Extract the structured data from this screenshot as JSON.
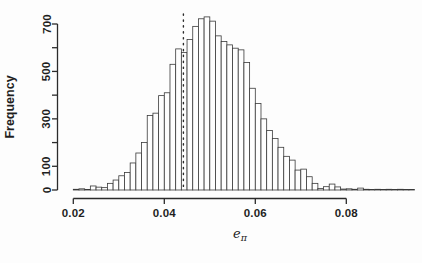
{
  "figure": {
    "background": "#fdfdfd",
    "line_color": "#2b2b2b",
    "text_color": "#1f1f1f"
  },
  "chart_data": {
    "type": "bar",
    "subtype": "histogram",
    "title": "",
    "ylabel": "Frequency",
    "xlabel_base": "e",
    "xlabel_sub": "π",
    "bin_start": 0.02,
    "bin_width": 0.00125,
    "values": [
      3,
      5,
      2,
      17,
      12,
      10,
      28,
      42,
      60,
      74,
      114,
      156,
      200,
      314,
      324,
      398,
      410,
      530,
      595,
      580,
      635,
      690,
      722,
      730,
      712,
      650,
      626,
      612,
      598,
      591,
      538,
      429,
      365,
      300,
      251,
      217,
      180,
      142,
      126,
      84,
      88,
      56,
      28,
      6,
      14,
      25,
      13,
      4,
      5,
      3,
      8,
      3,
      2,
      3,
      2,
      3,
      2,
      3,
      2,
      2
    ],
    "xlim": [
      0.02,
      0.095
    ],
    "ylim": [
      0,
      700
    ],
    "x_ticks": [
      0.02,
      0.04,
      0.06,
      0.08
    ],
    "x_tick_labels": [
      "0.02",
      "0.04",
      "0.06",
      "0.08"
    ],
    "y_ticks": [
      0,
      100,
      200,
      300,
      400,
      500,
      600,
      700
    ],
    "y_tick_labels": [
      "0",
      "100",
      "",
      "300",
      "",
      "500",
      "",
      "700"
    ],
    "vline_x": 0.0442,
    "vline_style": "dotted",
    "bar_fill": "#fefefe",
    "bar_stroke": "#3a3a3a",
    "grid": false,
    "legend": null
  }
}
